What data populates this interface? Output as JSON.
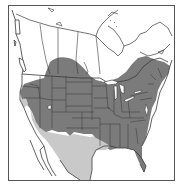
{
  "map": {
    "title": "",
    "region": "North America",
    "colors": {
      "background": "#ffffff",
      "land": "#ffffff",
      "border": "#3a3a3a",
      "frame": "#555555",
      "range_primary": "#7b7b7b",
      "range_secondary": "#c9c9c9"
    },
    "legend": [
      {
        "label": "",
        "color": "#7b7b7b"
      },
      {
        "label": "",
        "color": "#c9c9c9"
      }
    ]
  }
}
